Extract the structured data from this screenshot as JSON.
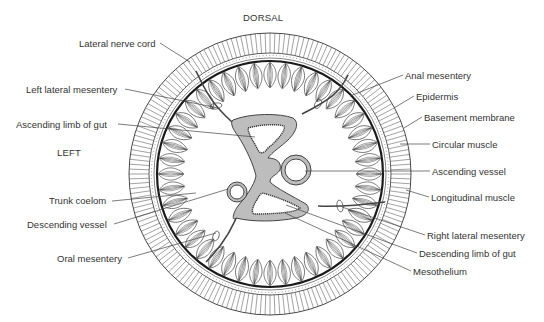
{
  "figure": {
    "orientation": {
      "top": "DORSAL",
      "left": "LEFT"
    },
    "colors": {
      "line": "#333333",
      "gut_fill": "#bdbdbd",
      "background": "#ffffff"
    }
  },
  "labels_left": [
    {
      "text": "Lateral nerve cord",
      "x": 79,
      "y": 38
    },
    {
      "text": "Left lateral mesentery",
      "x": 26,
      "y": 84
    },
    {
      "text": "Ascending limb of gut",
      "x": 16,
      "y": 119
    },
    {
      "text": "Trunk coelom",
      "x": 49,
      "y": 195
    },
    {
      "text": "Descending vessel",
      "x": 27,
      "y": 219
    },
    {
      "text": "Oral mesentery",
      "x": 57,
      "y": 253
    }
  ],
  "labels_right": [
    {
      "text": "Anal mesentery",
      "x": 405,
      "y": 70
    },
    {
      "text": "Epidermis",
      "x": 416,
      "y": 91
    },
    {
      "text": "Basement membrane",
      "x": 424,
      "y": 112
    },
    {
      "text": "Circular muscle",
      "x": 432,
      "y": 139
    },
    {
      "text": "Ascending vessel",
      "x": 432,
      "y": 166
    },
    {
      "text": "Longitudinal muscle",
      "x": 431,
      "y": 192
    },
    {
      "text": "Right lateral mesentery",
      "x": 427,
      "y": 230
    },
    {
      "text": "Descending limb of gut",
      "x": 419,
      "y": 248
    },
    {
      "text": "Mesothelium",
      "x": 413,
      "y": 266
    }
  ],
  "directions": [
    {
      "text": "DORSAL",
      "x": 243,
      "y": 12
    },
    {
      "text": "LEFT",
      "x": 57,
      "y": 147
    }
  ]
}
